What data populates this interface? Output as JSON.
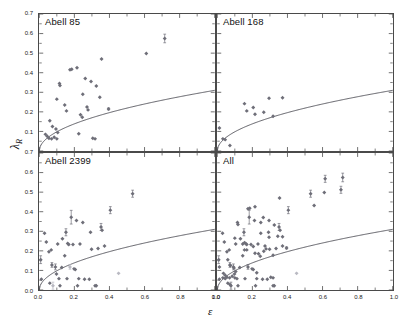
{
  "figure": {
    "xlabel": "ε",
    "ylabel_base": "λ",
    "ylabel_sub": "R",
    "marker_color": "#6e6e78",
    "marker_color_light": "#b9b9c2",
    "curve_color": "#4a4a52",
    "axis_color": "#4a4a4a"
  },
  "chart_data": [
    {
      "type": "scatter",
      "title": "Abell 85",
      "xlabel": "ε",
      "ylabel": "λ_R",
      "xlim": [
        0.0,
        1.0
      ],
      "ylim": [
        0.0,
        0.7
      ],
      "xticks": [
        "0.0",
        "0.2",
        "0.4",
        "0.6",
        "0.8",
        "1.0"
      ],
      "yticks": [
        "0.0",
        "0.1",
        "0.2",
        "0.3",
        "0.4",
        "0.5",
        "0.6",
        "0.7"
      ],
      "grid": false,
      "legend": "none",
      "curve_label": "slow/fast rotator divider",
      "curve_formula": "0.31*sqrt(eps)",
      "points": [
        {
          "x": 0.035,
          "y": 0.085,
          "e": 0.0
        },
        {
          "x": 0.045,
          "y": 0.075,
          "e": 0.0
        },
        {
          "x": 0.055,
          "y": 0.065,
          "e": 0.0
        },
        {
          "x": 0.07,
          "y": 0.062,
          "e": 0.0
        },
        {
          "x": 0.085,
          "y": 0.07,
          "e": 0.0
        },
        {
          "x": 0.1,
          "y": 0.062,
          "e": 0.0
        },
        {
          "x": 0.06,
          "y": 0.155,
          "e": 0.0
        },
        {
          "x": 0.075,
          "y": 0.125,
          "e": 0.0
        },
        {
          "x": 0.095,
          "y": 0.112,
          "e": 0.0
        },
        {
          "x": 0.105,
          "y": 0.095,
          "e": 0.0
        },
        {
          "x": 0.1,
          "y": 0.265,
          "e": 0.0
        },
        {
          "x": 0.115,
          "y": 0.345,
          "e": 0.0
        },
        {
          "x": 0.118,
          "y": 0.335,
          "e": 0.0
        },
        {
          "x": 0.145,
          "y": 0.235,
          "e": 0.0
        },
        {
          "x": 0.155,
          "y": 0.205,
          "e": 0.0
        },
        {
          "x": 0.175,
          "y": 0.415,
          "e": 0.0
        },
        {
          "x": 0.185,
          "y": 0.418,
          "e": 0.0
        },
        {
          "x": 0.215,
          "y": 0.425,
          "e": 0.0
        },
        {
          "x": 0.225,
          "y": 0.088,
          "e": 0.0
        },
        {
          "x": 0.235,
          "y": 0.185,
          "e": 0.0
        },
        {
          "x": 0.245,
          "y": 0.172,
          "e": 0.0
        },
        {
          "x": 0.248,
          "y": 0.29,
          "e": 0.0
        },
        {
          "x": 0.262,
          "y": 0.37,
          "e": 0.0
        },
        {
          "x": 0.272,
          "y": 0.225,
          "e": 0.0
        },
        {
          "x": 0.278,
          "y": 0.21,
          "e": 0.0
        },
        {
          "x": 0.295,
          "y": 0.355,
          "e": 0.0
        },
        {
          "x": 0.305,
          "y": 0.065,
          "e": 0.0
        },
        {
          "x": 0.318,
          "y": 0.062,
          "e": 0.0
        },
        {
          "x": 0.325,
          "y": 0.332,
          "e": 0.0
        },
        {
          "x": 0.345,
          "y": 0.275,
          "e": 0.0
        },
        {
          "x": 0.355,
          "y": 0.47,
          "e": 0.0
        },
        {
          "x": 0.395,
          "y": 0.215,
          "e": 0.005
        },
        {
          "x": 0.61,
          "y": 0.498,
          "e": 0.0
        },
        {
          "x": 0.715,
          "y": 0.575,
          "e": 0.022
        }
      ]
    },
    {
      "type": "scatter",
      "title": "Abell 168",
      "xlabel": "ε",
      "ylabel": "λ_R",
      "xlim": [
        0.0,
        1.0
      ],
      "ylim": [
        0.0,
        0.7
      ],
      "xticks": [
        "0.0",
        "0.2",
        "0.4",
        "0.6",
        "0.8",
        "1.0"
      ],
      "yticks": [
        "0.0",
        "0.1",
        "0.2",
        "0.3",
        "0.4",
        "0.5",
        "0.6",
        "0.7"
      ],
      "grid": false,
      "legend": "none",
      "curve_formula": "0.31*sqrt(eps)",
      "points": [
        {
          "x": 0.012,
          "y": 0.118,
          "e": 0.0
        },
        {
          "x": 0.032,
          "y": 0.062,
          "e": 0.0
        },
        {
          "x": 0.045,
          "y": 0.058,
          "e": 0.0
        },
        {
          "x": 0.072,
          "y": 0.028,
          "e": 0.0
        },
        {
          "x": 0.155,
          "y": 0.242,
          "e": 0.0
        },
        {
          "x": 0.168,
          "y": 0.205,
          "e": 0.0
        },
        {
          "x": 0.205,
          "y": 0.222,
          "e": 0.0
        },
        {
          "x": 0.215,
          "y": 0.188,
          "e": 0.0
        },
        {
          "x": 0.265,
          "y": 0.198,
          "e": 0.0
        },
        {
          "x": 0.295,
          "y": 0.27,
          "e": 0.0
        },
        {
          "x": 0.318,
          "y": 0.178,
          "e": 0.0
        },
        {
          "x": 0.372,
          "y": 0.272,
          "e": 0.0
        }
      ]
    },
    {
      "type": "scatter",
      "title": "Abell 2399",
      "xlabel": "ε",
      "ylabel": "λ_R",
      "xlim": [
        0.0,
        1.0
      ],
      "ylim": [
        0.0,
        0.7
      ],
      "xticks": [
        "0.0",
        "0.2",
        "0.4",
        "0.6",
        "0.8",
        "1.0"
      ],
      "yticks": [
        "0.0",
        "0.1",
        "0.2",
        "0.3",
        "0.4",
        "0.5",
        "0.6",
        "0.7"
      ],
      "grid": false,
      "legend": "none",
      "curve_formula": "0.31*sqrt(eps)",
      "points": [
        {
          "x": 0.008,
          "y": 0.155,
          "e": 0.02
        },
        {
          "x": 0.012,
          "y": 0.055,
          "e": 0.0
        },
        {
          "x": 0.03,
          "y": 0.29,
          "e": 0.0
        },
        {
          "x": 0.04,
          "y": 0.245,
          "e": 0.0
        },
        {
          "x": 0.055,
          "y": 0.195,
          "e": 0.0
        },
        {
          "x": 0.06,
          "y": 0.035,
          "e": 0.0
        },
        {
          "x": 0.068,
          "y": 0.205,
          "e": 0.0
        },
        {
          "x": 0.072,
          "y": 0.128,
          "e": 0.012
        },
        {
          "x": 0.078,
          "y": 0.022,
          "e": 0.018,
          "light": true
        },
        {
          "x": 0.092,
          "y": 0.118,
          "e": 0.015
        },
        {
          "x": 0.098,
          "y": 0.082,
          "e": 0.0
        },
        {
          "x": 0.105,
          "y": 0.235,
          "e": 0.0
        },
        {
          "x": 0.112,
          "y": 0.058,
          "e": 0.0
        },
        {
          "x": 0.118,
          "y": 0.022,
          "e": 0.0
        },
        {
          "x": 0.128,
          "y": 0.115,
          "e": 0.0
        },
        {
          "x": 0.132,
          "y": 0.262,
          "e": 0.0
        },
        {
          "x": 0.145,
          "y": 0.175,
          "e": 0.0
        },
        {
          "x": 0.152,
          "y": 0.295,
          "e": 0.018
        },
        {
          "x": 0.158,
          "y": 0.058,
          "e": 0.0
        },
        {
          "x": 0.162,
          "y": 0.238,
          "e": 0.0
        },
        {
          "x": 0.168,
          "y": 0.232,
          "e": 0.0
        },
        {
          "x": 0.175,
          "y": 0.118,
          "e": 0.012,
          "light": true
        },
        {
          "x": 0.182,
          "y": 0.372,
          "e": 0.035
        },
        {
          "x": 0.192,
          "y": 0.232,
          "e": 0.0
        },
        {
          "x": 0.198,
          "y": 0.108,
          "e": 0.0
        },
        {
          "x": 0.205,
          "y": 0.105,
          "e": 0.0
        },
        {
          "x": 0.212,
          "y": 0.355,
          "e": 0.0
        },
        {
          "x": 0.218,
          "y": 0.022,
          "e": 0.0
        },
        {
          "x": 0.225,
          "y": 0.058,
          "e": 0.0
        },
        {
          "x": 0.232,
          "y": 0.235,
          "e": 0.0
        },
        {
          "x": 0.248,
          "y": 0.345,
          "e": 0.0
        },
        {
          "x": 0.258,
          "y": 0.055,
          "e": 0.0
        },
        {
          "x": 0.285,
          "y": 0.055,
          "e": 0.0
        },
        {
          "x": 0.292,
          "y": 0.295,
          "e": 0.0
        },
        {
          "x": 0.298,
          "y": 0.208,
          "e": 0.0
        },
        {
          "x": 0.318,
          "y": 0.022,
          "e": 0.0
        },
        {
          "x": 0.325,
          "y": 0.022,
          "e": 0.0
        },
        {
          "x": 0.335,
          "y": 0.212,
          "e": 0.0
        },
        {
          "x": 0.352,
          "y": 0.322,
          "e": 0.018
        },
        {
          "x": 0.358,
          "y": 0.305,
          "e": 0.0
        },
        {
          "x": 0.372,
          "y": 0.225,
          "e": 0.0
        },
        {
          "x": 0.405,
          "y": 0.408,
          "e": 0.018
        },
        {
          "x": 0.452,
          "y": 0.085,
          "e": 0.0,
          "light": true
        },
        {
          "x": 0.532,
          "y": 0.492,
          "e": 0.018
        }
      ]
    },
    {
      "type": "scatter",
      "title": "All",
      "xlabel": "ε",
      "ylabel": "λ_R",
      "xlim": [
        0.0,
        1.0
      ],
      "ylim": [
        0.0,
        0.7
      ],
      "xticks": [
        "0.0",
        "0.2",
        "0.4",
        "0.6",
        "0.8",
        "1.0"
      ],
      "yticks": [
        "0.0",
        "0.1",
        "0.2",
        "0.3",
        "0.4",
        "0.5",
        "0.6",
        "0.7"
      ],
      "grid": false,
      "legend": "none",
      "note": "combined sample of Abell 85, Abell 168 and Abell 2399",
      "curve_formula": "0.31*sqrt(eps)",
      "points": [
        {
          "x": 0.035,
          "y": 0.085,
          "e": 0.0
        },
        {
          "x": 0.045,
          "y": 0.075,
          "e": 0.0
        },
        {
          "x": 0.055,
          "y": 0.065,
          "e": 0.0
        },
        {
          "x": 0.07,
          "y": 0.062,
          "e": 0.0
        },
        {
          "x": 0.085,
          "y": 0.07,
          "e": 0.0
        },
        {
          "x": 0.1,
          "y": 0.062,
          "e": 0.0
        },
        {
          "x": 0.06,
          "y": 0.155,
          "e": 0.0
        },
        {
          "x": 0.075,
          "y": 0.125,
          "e": 0.0
        },
        {
          "x": 0.095,
          "y": 0.112,
          "e": 0.0
        },
        {
          "x": 0.105,
          "y": 0.095,
          "e": 0.0
        },
        {
          "x": 0.1,
          "y": 0.265,
          "e": 0.0
        },
        {
          "x": 0.115,
          "y": 0.345,
          "e": 0.0
        },
        {
          "x": 0.118,
          "y": 0.335,
          "e": 0.0
        },
        {
          "x": 0.145,
          "y": 0.235,
          "e": 0.0
        },
        {
          "x": 0.155,
          "y": 0.205,
          "e": 0.0
        },
        {
          "x": 0.175,
          "y": 0.415,
          "e": 0.0
        },
        {
          "x": 0.185,
          "y": 0.418,
          "e": 0.0
        },
        {
          "x": 0.215,
          "y": 0.425,
          "e": 0.0
        },
        {
          "x": 0.225,
          "y": 0.088,
          "e": 0.0
        },
        {
          "x": 0.235,
          "y": 0.185,
          "e": 0.0
        },
        {
          "x": 0.245,
          "y": 0.172,
          "e": 0.0
        },
        {
          "x": 0.248,
          "y": 0.29,
          "e": 0.0
        },
        {
          "x": 0.262,
          "y": 0.37,
          "e": 0.0
        },
        {
          "x": 0.272,
          "y": 0.225,
          "e": 0.0
        },
        {
          "x": 0.278,
          "y": 0.21,
          "e": 0.0
        },
        {
          "x": 0.295,
          "y": 0.355,
          "e": 0.0
        },
        {
          "x": 0.305,
          "y": 0.065,
          "e": 0.0
        },
        {
          "x": 0.318,
          "y": 0.062,
          "e": 0.0
        },
        {
          "x": 0.325,
          "y": 0.332,
          "e": 0.0
        },
        {
          "x": 0.345,
          "y": 0.275,
          "e": 0.0
        },
        {
          "x": 0.355,
          "y": 0.47,
          "e": 0.0
        },
        {
          "x": 0.395,
          "y": 0.215,
          "e": 0.005
        },
        {
          "x": 0.61,
          "y": 0.498,
          "e": 0.0
        },
        {
          "x": 0.715,
          "y": 0.575,
          "e": 0.022
        },
        {
          "x": 0.012,
          "y": 0.118,
          "e": 0.0
        },
        {
          "x": 0.032,
          "y": 0.062,
          "e": 0.0
        },
        {
          "x": 0.045,
          "y": 0.058,
          "e": 0.0
        },
        {
          "x": 0.072,
          "y": 0.028,
          "e": 0.0
        },
        {
          "x": 0.155,
          "y": 0.242,
          "e": 0.0
        },
        {
          "x": 0.168,
          "y": 0.205,
          "e": 0.0
        },
        {
          "x": 0.205,
          "y": 0.222,
          "e": 0.0
        },
        {
          "x": 0.215,
          "y": 0.188,
          "e": 0.0
        },
        {
          "x": 0.265,
          "y": 0.198,
          "e": 0.0
        },
        {
          "x": 0.295,
          "y": 0.27,
          "e": 0.0
        },
        {
          "x": 0.318,
          "y": 0.178,
          "e": 0.0
        },
        {
          "x": 0.372,
          "y": 0.272,
          "e": 0.0
        },
        {
          "x": 0.008,
          "y": 0.155,
          "e": 0.02
        },
        {
          "x": 0.012,
          "y": 0.055,
          "e": 0.0
        },
        {
          "x": 0.03,
          "y": 0.29,
          "e": 0.0
        },
        {
          "x": 0.04,
          "y": 0.245,
          "e": 0.0
        },
        {
          "x": 0.055,
          "y": 0.195,
          "e": 0.0
        },
        {
          "x": 0.06,
          "y": 0.035,
          "e": 0.0
        },
        {
          "x": 0.068,
          "y": 0.205,
          "e": 0.0
        },
        {
          "x": 0.072,
          "y": 0.128,
          "e": 0.012
        },
        {
          "x": 0.078,
          "y": 0.022,
          "e": 0.018
        },
        {
          "x": 0.092,
          "y": 0.118,
          "e": 0.015
        },
        {
          "x": 0.098,
          "y": 0.082,
          "e": 0.0
        },
        {
          "x": 0.105,
          "y": 0.235,
          "e": 0.0
        },
        {
          "x": 0.112,
          "y": 0.058,
          "e": 0.0
        },
        {
          "x": 0.118,
          "y": 0.022,
          "e": 0.0
        },
        {
          "x": 0.128,
          "y": 0.115,
          "e": 0.0
        },
        {
          "x": 0.132,
          "y": 0.262,
          "e": 0.0
        },
        {
          "x": 0.145,
          "y": 0.175,
          "e": 0.0
        },
        {
          "x": 0.152,
          "y": 0.295,
          "e": 0.018
        },
        {
          "x": 0.158,
          "y": 0.058,
          "e": 0.0
        },
        {
          "x": 0.162,
          "y": 0.238,
          "e": 0.0
        },
        {
          "x": 0.168,
          "y": 0.232,
          "e": 0.0
        },
        {
          "x": 0.175,
          "y": 0.118,
          "e": 0.012
        },
        {
          "x": 0.182,
          "y": 0.372,
          "e": 0.035
        },
        {
          "x": 0.192,
          "y": 0.232,
          "e": 0.0
        },
        {
          "x": 0.198,
          "y": 0.108,
          "e": 0.0
        },
        {
          "x": 0.205,
          "y": 0.105,
          "e": 0.0
        },
        {
          "x": 0.212,
          "y": 0.355,
          "e": 0.0
        },
        {
          "x": 0.218,
          "y": 0.022,
          "e": 0.0
        },
        {
          "x": 0.225,
          "y": 0.058,
          "e": 0.0
        },
        {
          "x": 0.232,
          "y": 0.235,
          "e": 0.0
        },
        {
          "x": 0.248,
          "y": 0.345,
          "e": 0.0
        },
        {
          "x": 0.258,
          "y": 0.055,
          "e": 0.0
        },
        {
          "x": 0.285,
          "y": 0.055,
          "e": 0.0
        },
        {
          "x": 0.292,
          "y": 0.295,
          "e": 0.0
        },
        {
          "x": 0.298,
          "y": 0.208,
          "e": 0.0
        },
        {
          "x": 0.318,
          "y": 0.022,
          "e": 0.0
        },
        {
          "x": 0.325,
          "y": 0.022,
          "e": 0.0
        },
        {
          "x": 0.335,
          "y": 0.212,
          "e": 0.0
        },
        {
          "x": 0.352,
          "y": 0.322,
          "e": 0.018
        },
        {
          "x": 0.358,
          "y": 0.305,
          "e": 0.0
        },
        {
          "x": 0.372,
          "y": 0.225,
          "e": 0.0
        },
        {
          "x": 0.405,
          "y": 0.408,
          "e": 0.018
        },
        {
          "x": 0.452,
          "y": 0.085,
          "e": 0.0,
          "light": true
        },
        {
          "x": 0.532,
          "y": 0.492,
          "e": 0.018
        },
        {
          "x": 0.615,
          "y": 0.568,
          "e": 0.018
        },
        {
          "x": 0.705,
          "y": 0.512,
          "e": 0.018
        },
        {
          "x": 0.552,
          "y": 0.432,
          "e": 0.0
        }
      ]
    }
  ]
}
